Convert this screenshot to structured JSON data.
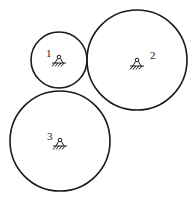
{
  "diagram": {
    "type": "gear-train",
    "stroke_color": "#1a1a1a",
    "background": "#ffffff",
    "wheels": [
      {
        "id": "1",
        "label": "1",
        "cx": 59,
        "cy": 60,
        "r": 28,
        "label_x": 46,
        "label_y": 57,
        "pivot_x": 59,
        "pivot_y": 61
      },
      {
        "id": "2",
        "label": "2",
        "cx": 137,
        "cy": 60,
        "r": 50,
        "label_x": 150,
        "label_y": 59,
        "pivot_x": 137,
        "pivot_y": 64
      },
      {
        "id": "3",
        "label": "3",
        "cx": 60,
        "cy": 141,
        "r": 50,
        "label_x": 47,
        "label_y": 140,
        "pivot_x": 60,
        "pivot_y": 144
      }
    ]
  }
}
